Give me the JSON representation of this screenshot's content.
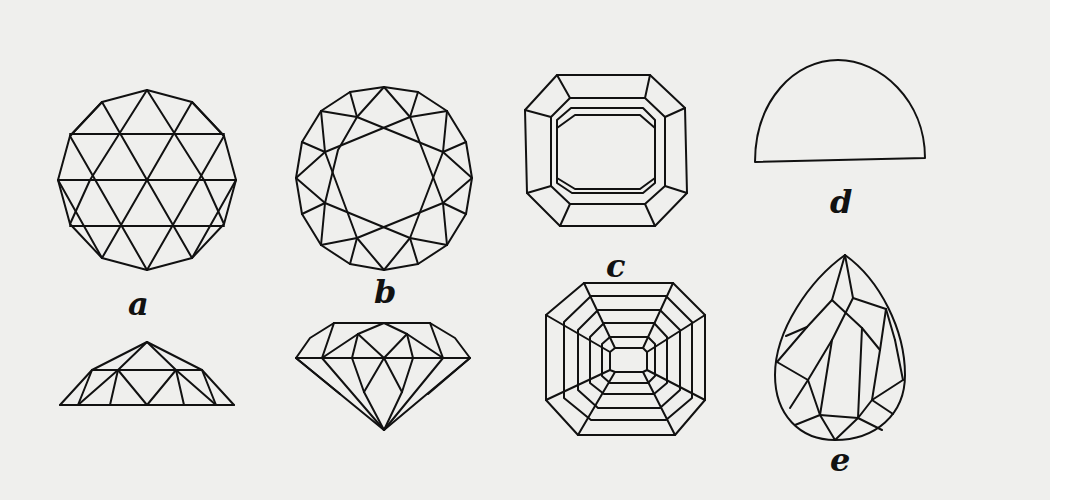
{
  "figure": {
    "colors": {
      "background": "#efefed",
      "margin": "#ffffff",
      "ink": "#111111"
    },
    "items": [
      {
        "id": "a",
        "label": "a",
        "views": [
          "top",
          "side"
        ],
        "description": "rose cut"
      },
      {
        "id": "b",
        "label": "b",
        "views": [
          "top",
          "side"
        ],
        "description": "brilliant cut"
      },
      {
        "id": "c",
        "label": "c",
        "views": [
          "top",
          "bottom"
        ],
        "description": "step / emerald cut"
      },
      {
        "id": "d",
        "label": "d",
        "views": [
          "side"
        ],
        "description": "cabochon"
      },
      {
        "id": "e",
        "label": "e",
        "views": [
          "top"
        ],
        "description": "pear / pendeloque cut"
      }
    ]
  }
}
